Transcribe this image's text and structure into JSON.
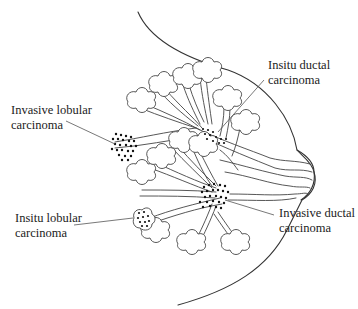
{
  "diagram": {
    "labels": [
      {
        "id": "invasive-lobular",
        "line1": "Invasive lobular",
        "line2": "carcinoma"
      },
      {
        "id": "insitu-ductal",
        "line1": "Insitu ductal",
        "line2": "carcinoma"
      },
      {
        "id": "insitu-lobular",
        "line1": "Insitu lobular",
        "line2": "carcinoma"
      },
      {
        "id": "invasive-ductal",
        "line1": "Invasive ductal",
        "line2": "carcinoma"
      }
    ],
    "colors": {
      "line": "#333333",
      "text": "#222222",
      "cells": "#111111",
      "background": "#ffffff"
    }
  }
}
